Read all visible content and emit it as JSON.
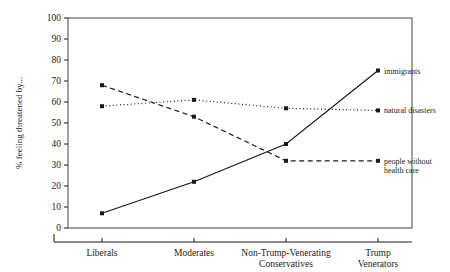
{
  "chart_data": {
    "type": "line",
    "title": "",
    "xlabel": "",
    "ylabel": "% feeling threatened by...",
    "ylim": [
      0,
      100
    ],
    "ytick_step": 10,
    "yticks": [
      "0",
      "10",
      "20",
      "30",
      "40",
      "50",
      "60",
      "70",
      "80",
      "90",
      "100"
    ],
    "grid": false,
    "legend_position": "right-endpoint-labels",
    "categories": [
      "Liberals",
      "Moderates",
      "Non-Trump-Venerating Conservatives",
      "Trump Venerators"
    ],
    "category_lines": [
      [
        "Liberals"
      ],
      [
        "Moderates"
      ],
      [
        "Non-Trump-Venerating",
        "Conservatives"
      ],
      [
        "Trump",
        "Venerators"
      ]
    ],
    "series": [
      {
        "name": "immigrants",
        "label_lines": [
          "immigrants"
        ],
        "style": "solid",
        "color": "#1a1a1a",
        "values": [
          7,
          22,
          40,
          75
        ]
      },
      {
        "name": "natural disasters",
        "label_lines": [
          "natural disasters"
        ],
        "style": "dotted",
        "color": "#1a1a1a",
        "values": [
          58,
          61,
          57,
          56
        ]
      },
      {
        "name": "people without health care",
        "label_lines": [
          "people without",
          "health care"
        ],
        "style": "dashed",
        "color": "#1a1a1a",
        "values": [
          68,
          53,
          32,
          32
        ]
      }
    ]
  },
  "axis": {
    "y_title": "% feeling threatened by..."
  },
  "colors": {
    "ink": "#1a1a1a",
    "frame": "#555555",
    "background": "#ffffff"
  }
}
